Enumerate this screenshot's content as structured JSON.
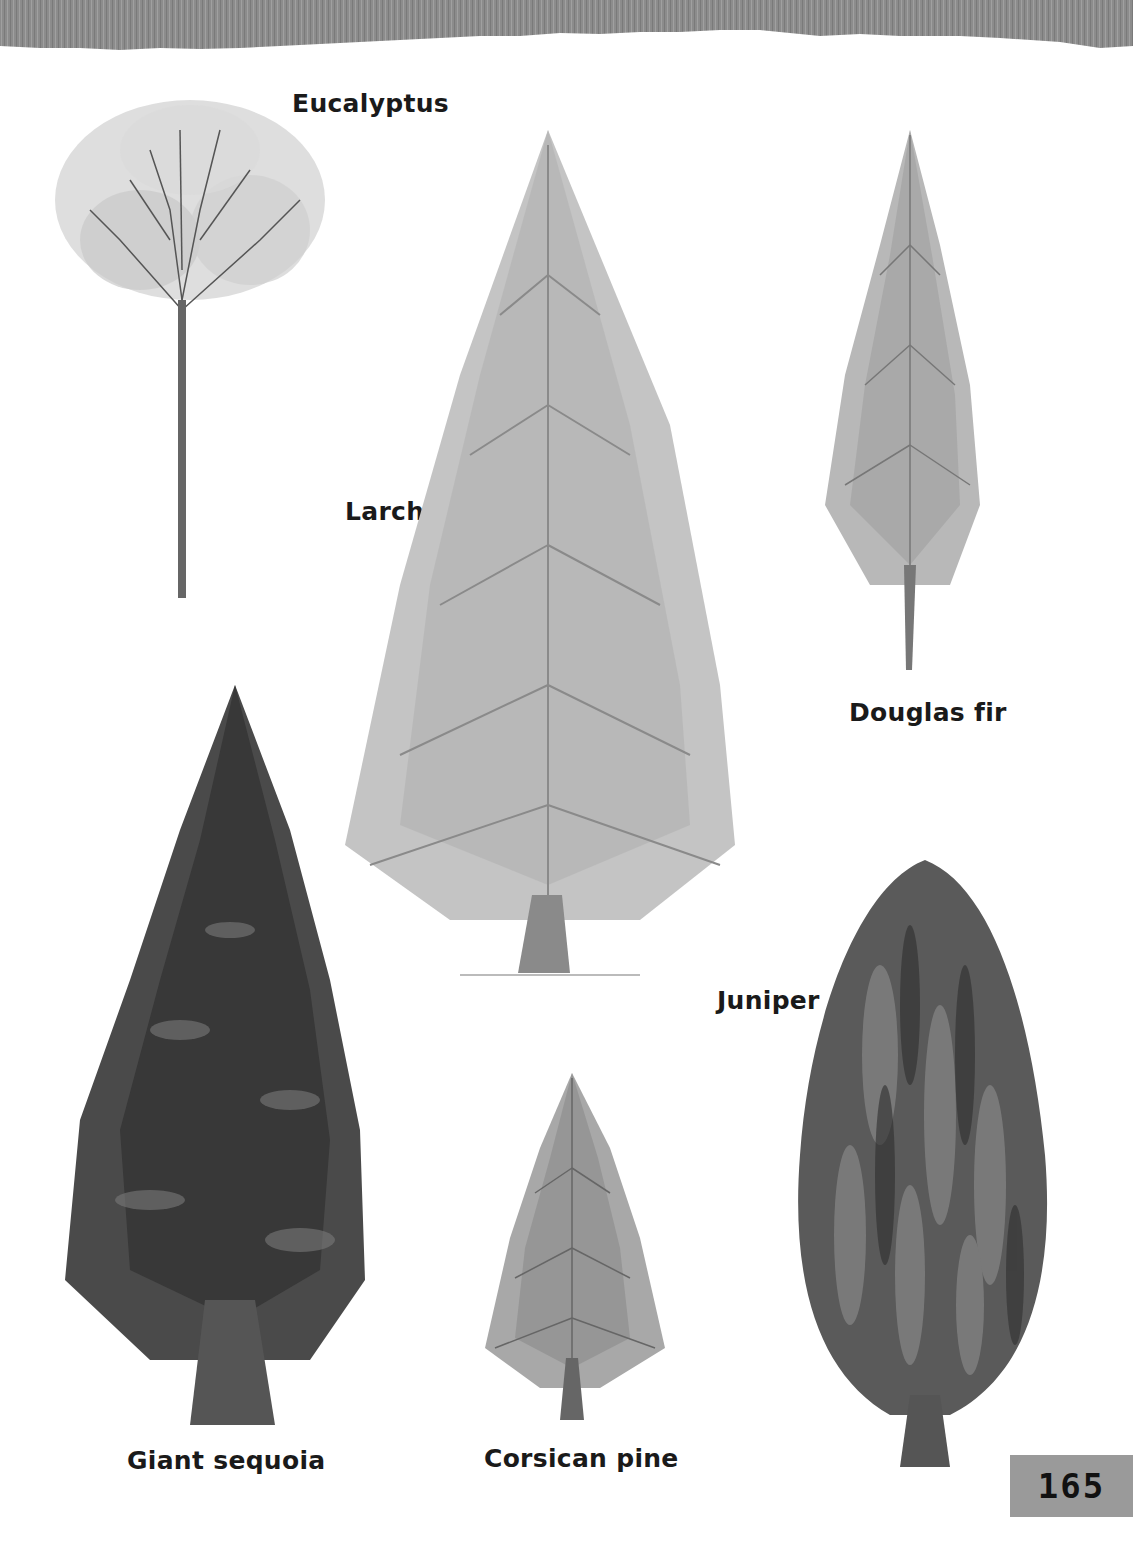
{
  "page": {
    "page_number": "165",
    "header_color": "#8c8c8c",
    "page_number_box_color": "#9a9a9a"
  },
  "trees": [
    {
      "id": "eucalyptus",
      "label": "Eucalyptus"
    },
    {
      "id": "larch",
      "label": "Larch"
    },
    {
      "id": "douglas-fir",
      "label": "Douglas fir"
    },
    {
      "id": "giant-sequoia",
      "label": "Giant sequoia"
    },
    {
      "id": "corsican-pine",
      "label": "Corsican pine"
    },
    {
      "id": "juniper",
      "label": "Juniper"
    }
  ]
}
